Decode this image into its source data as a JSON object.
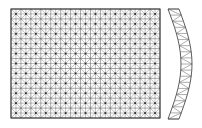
{
  "figure": {
    "title": "Finite element mesh of a rectangular plate and a curved strip",
    "background_color": "#ffffff",
    "width": 202,
    "height": 128
  },
  "palette": {
    "plate_edge": "#3c3c3c",
    "grid_line": "#5a5a5a",
    "diagonal_line": "#6e6e6e",
    "node_dot": "#2b2b2b",
    "arc_edge": "#4a4a4a",
    "arc_rib": "#6a6a6a",
    "fill": "#ffffff"
  },
  "chart_data": {
    "type": "diagram",
    "title": "Finite element mesh of a rectangular plate and a curved strip",
    "parts": [
      {
        "name": "rectangular-plate-mesh",
        "shape": "rectangle",
        "x": 11,
        "y": 9,
        "width": 149,
        "height": 109,
        "columns": 15,
        "rows": 11,
        "cell_width": 9.93,
        "cell_height": 9.91,
        "cell_pattern": "square-with-both-diagonals-and-central-cross",
        "triangles_per_cell": 8,
        "node_markers": true,
        "total_cells": 165,
        "total_triangles": 1320
      },
      {
        "name": "curved-strip-mesh",
        "shape": "circular-arc-band",
        "x": 168,
        "y": 9,
        "width": 30,
        "height": 110,
        "band_thickness": 11,
        "bulge_direction": "right",
        "bulge_amount": 13,
        "segments": 18,
        "cell_pattern": "alternating-zigzag-triangles",
        "triangles_per_segment": 2,
        "total_triangles": 36
      }
    ]
  }
}
